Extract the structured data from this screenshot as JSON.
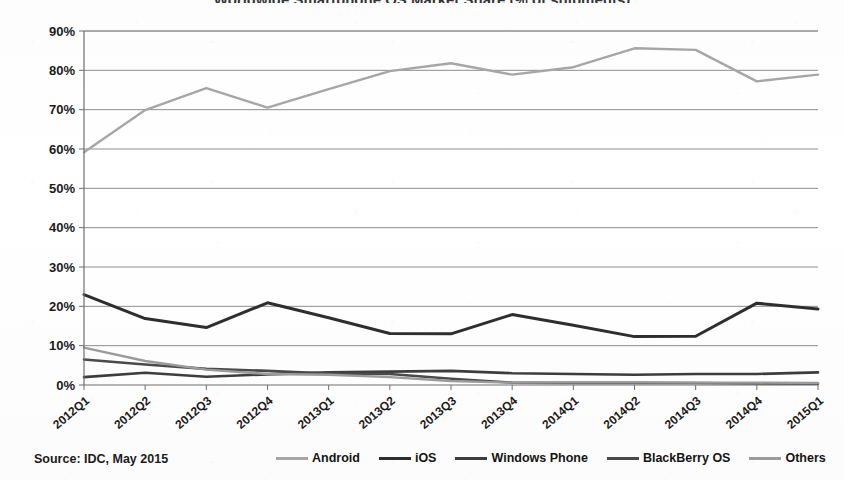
{
  "chart_data": {
    "type": "line",
    "title": "Worldwide Smartphone OS Market Share (% of shipments)",
    "xlabel": "",
    "ylabel": "",
    "ylim": [
      0,
      90
    ],
    "ytick_step": 10,
    "grid": true,
    "legend_position": "bottom",
    "source": "Source: IDC, May 2015",
    "ytick_labels": [
      "0%",
      "10%",
      "20%",
      "30%",
      "40%",
      "50%",
      "60%",
      "70%",
      "80%",
      "90%"
    ],
    "categories": [
      "2012Q1",
      "2012Q2",
      "2012Q3",
      "2012Q4",
      "2013Q1",
      "2013Q2",
      "2013Q3",
      "2013Q4",
      "2014Q1",
      "2014Q2",
      "2014Q3",
      "2014Q4",
      "2015Q1"
    ],
    "series": [
      {
        "name": "Android",
        "color": "#a6a6a6",
        "width": 2.4,
        "values": [
          59.2,
          69.9,
          75.5,
          70.5,
          75.2,
          79.8,
          81.8,
          78.9,
          80.8,
          85.6,
          85.2,
          77.2,
          78.9
        ]
      },
      {
        "name": "iOS",
        "color": "#2e2e2e",
        "width": 3.0,
        "values": [
          23.0,
          16.9,
          14.6,
          20.9,
          17.1,
          13.1,
          13.0,
          17.9,
          15.2,
          12.3,
          12.4,
          20.8,
          19.3
        ]
      },
      {
        "name": "Windows Phone",
        "color": "#3d3d3d",
        "width": 2.6,
        "values": [
          2.0,
          3.1,
          2.1,
          2.7,
          3.2,
          3.4,
          3.6,
          3.0,
          2.8,
          2.6,
          2.8,
          2.8,
          3.2
        ]
      },
      {
        "name": "BlackBerry OS",
        "color": "#4a4a4a",
        "width": 2.6,
        "values": [
          6.5,
          5.2,
          4.1,
          3.6,
          2.9,
          2.8,
          1.6,
          0.6,
          0.5,
          0.5,
          0.5,
          0.4,
          0.3
        ]
      },
      {
        "name": "Others",
        "color": "#9b9b9b",
        "width": 2.4,
        "values": [
          9.5,
          6.1,
          3.9,
          2.8,
          2.6,
          2.0,
          1.0,
          0.6,
          0.7,
          0.7,
          0.6,
          0.6,
          0.5
        ]
      }
    ]
  },
  "legend": {
    "items": [
      {
        "label": "Android"
      },
      {
        "label": "iOS"
      },
      {
        "label": "Windows Phone"
      },
      {
        "label": "BlackBerry OS"
      },
      {
        "label": "Others"
      }
    ]
  },
  "footer": {
    "source_text": "Source: IDC, May 2015"
  }
}
